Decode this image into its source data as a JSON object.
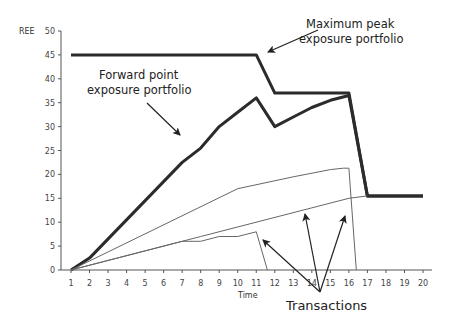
{
  "chart_data": {
    "type": "line",
    "title": "",
    "xlabel": "Time",
    "ylabel": "REE",
    "xlim": [
      1,
      20
    ],
    "ylim": [
      0,
      50
    ],
    "x_ticks": [
      1,
      2,
      3,
      4,
      5,
      6,
      7,
      8,
      9,
      10,
      11,
      12,
      13,
      14,
      15,
      16,
      17,
      18,
      19,
      20
    ],
    "y_ticks": [
      0,
      5,
      10,
      15,
      20,
      25,
      30,
      35,
      40,
      45,
      50
    ],
    "grid": false,
    "legend": null,
    "series": [
      {
        "name": "Maximum peak exposure portfolio",
        "style": "thick",
        "points": [
          [
            1,
            45
          ],
          [
            11,
            45
          ],
          [
            12,
            37
          ],
          [
            16,
            37
          ],
          [
            17,
            15.5
          ],
          [
            20,
            15.5
          ]
        ]
      },
      {
        "name": "Forward point exposure portfolio",
        "style": "thick",
        "points": [
          [
            1,
            0
          ],
          [
            2,
            2.5
          ],
          [
            7,
            22.5
          ],
          [
            8,
            25.5
          ],
          [
            9,
            30
          ],
          [
            10,
            33
          ],
          [
            11,
            36
          ],
          [
            12,
            30
          ],
          [
            13,
            32
          ],
          [
            14,
            34
          ],
          [
            15,
            35.5
          ],
          [
            16,
            36.5
          ],
          [
            17,
            15.5
          ],
          [
            20,
            15.5
          ]
        ]
      },
      {
        "name": "Transaction A",
        "style": "thin",
        "points": [
          [
            1,
            0
          ],
          [
            10,
            17
          ],
          [
            13,
            19.5
          ],
          [
            15,
            21
          ],
          [
            15.7,
            21.3
          ],
          [
            16,
            21.3
          ],
          [
            16.4,
            0
          ]
        ]
      },
      {
        "name": "Transaction B",
        "style": "thin",
        "points": [
          [
            1,
            0
          ],
          [
            8,
            7
          ],
          [
            16,
            15
          ],
          [
            17,
            15.5
          ]
        ]
      },
      {
        "name": "Transaction C",
        "style": "thin",
        "points": [
          [
            1,
            0
          ],
          [
            7,
            6
          ],
          [
            8,
            6
          ],
          [
            9,
            7
          ],
          [
            10,
            7
          ],
          [
            11,
            8
          ],
          [
            11.6,
            0
          ]
        ]
      }
    ],
    "annotations": [
      {
        "text": [
          "Maximum peak",
          "exposure portfolio"
        ],
        "arrow_to": [
          11.2,
          45
        ]
      },
      {
        "text": [
          "Forward point",
          "exposure portfolio"
        ],
        "arrow_to": [
          6.9,
          21
        ]
      },
      {
        "text": [
          "Transactions"
        ],
        "arrows_to": [
          [
            11.6,
            5.5
          ],
          [
            14.2,
            14.5
          ],
          [
            16.7,
            14.5
          ]
        ]
      }
    ]
  },
  "labels": {
    "ylabel": "REE",
    "xlabel": "Time",
    "annot_max_1": "Maximum peak",
    "annot_max_2": "exposure portfolio",
    "annot_fwd_1": "Forward point",
    "annot_fwd_2": "exposure portfolio",
    "annot_tx": "Transactions"
  }
}
